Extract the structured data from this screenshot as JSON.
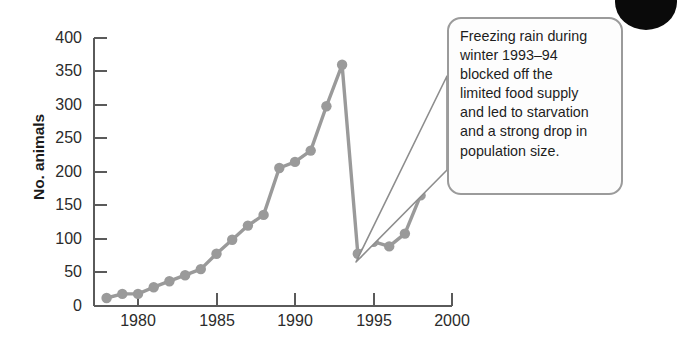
{
  "figure": {
    "background": "#ffffff",
    "series_color": "#9a9a9a",
    "axis_color": "#5a5a5a"
  },
  "axes": {
    "y_title": "No. animals",
    "y_ticks": [
      "0",
      "50",
      "100",
      "150",
      "200",
      "250",
      "300",
      "350",
      "400"
    ],
    "x_ticks": [
      "1980",
      "1985",
      "1990",
      "1995",
      "2000"
    ]
  },
  "callout": {
    "text": "Freezing rain during winter 1993–94 blocked off the limited food supply and led to starvation and a strong drop in population size.",
    "lines": "Freezing rain during\nwinter 1993–94\nblocked off the\nlimited food supply\nand led to starvation\nand a strong drop in\npopulation size.",
    "border_color": "#9b9b9b",
    "points_to_year": 1994
  },
  "chart_data": {
    "type": "line",
    "title": "",
    "xlabel": "",
    "ylabel": "No. animals",
    "xlim": [
      1977.4,
      2000
    ],
    "ylim": [
      0,
      400
    ],
    "grid": false,
    "legend": "none",
    "markers": true,
    "x": [
      1978,
      1979,
      1980,
      1981,
      1982,
      1983,
      1984,
      1985,
      1986,
      1987,
      1988,
      1989,
      1990,
      1991,
      1992,
      1993,
      1994,
      1995,
      1996,
      1997,
      1998
    ],
    "y": [
      12,
      18,
      18,
      28,
      37,
      46,
      55,
      78,
      99,
      120,
      136,
      206,
      215,
      232,
      298,
      360,
      78,
      96,
      89,
      108,
      165
    ],
    "series": [
      {
        "name": "No. animals",
        "values": [
          12,
          18,
          18,
          28,
          37,
          46,
          55,
          78,
          99,
          120,
          136,
          206,
          215,
          232,
          298,
          360,
          78,
          96,
          89,
          108,
          165
        ]
      }
    ],
    "annotations": [
      {
        "text": "Freezing rain during winter 1993–94 blocked off the limited food supply and led to starvation and a strong drop in population size.",
        "target_x": 1994,
        "target_y": 78
      }
    ]
  }
}
